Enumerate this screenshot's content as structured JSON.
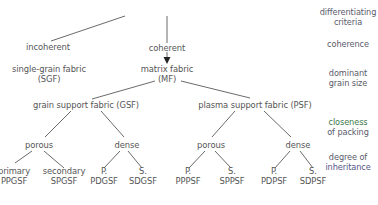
{
  "criteria": {
    "differentiating_criteria": [
      "differentiating",
      "criteria"
    ],
    "coherence": "coherence",
    "dominant_grain_size": [
      "dominant",
      "grain size"
    ],
    "closeness_of_packing": [
      "closeness",
      "of packing"
    ],
    "degree_of_inheritance": [
      "degree of",
      "inheritance"
    ]
  },
  "level1": {
    "incoherent": "incoherent",
    "coherent": "coherent"
  },
  "level2": {
    "sgf": [
      "single-grain fabric",
      "(SGF)"
    ],
    "mf": [
      "matrix fabric",
      "(MF)"
    ]
  },
  "level3": {
    "gsf": "grain support fabric (GSF)",
    "psf": "plasma support fabric (PSF)"
  },
  "level4": {
    "gsf_porous": "porous",
    "gsf_dense": "dense",
    "psf_porous": "porous",
    "psf_dense": "dense"
  },
  "leaves": [
    {
      "top": "primary",
      "bottom": "PPGSF"
    },
    {
      "top": "secondary",
      "bottom": "SPGSF"
    },
    {
      "top": "P.",
      "bottom": "PDGSF"
    },
    {
      "top": "S.",
      "bottom": "SDGSF"
    },
    {
      "top": "P.",
      "bottom": "PPPSF"
    },
    {
      "top": "S.",
      "bottom": "SPPSF"
    },
    {
      "top": "P.",
      "bottom": "PDPSF"
    },
    {
      "top": "S.",
      "bottom": "SDPSF"
    }
  ],
  "colors": {
    "text": "#555555",
    "lines": "#444444",
    "closeness_accent": "#3a8a4a",
    "inheritance_accent": "#5a5aa0"
  }
}
